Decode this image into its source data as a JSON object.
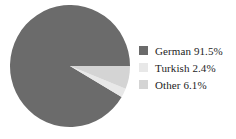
{
  "chart_data": {
    "type": "pie",
    "title": "",
    "categories": [
      "German",
      "Turkish",
      "Other"
    ],
    "values": [
      91.5,
      2.4,
      6.1
    ],
    "value_unit": "%",
    "colors": [
      "#6b6b6b",
      "#e8e8e8",
      "#d4d4d4"
    ],
    "legend_position": "right",
    "grid": false,
    "start_angle_oclock": 3,
    "direction": "counterclockwise",
    "background": "#ffffff",
    "slices": [
      {
        "label": "German",
        "value": 91.5,
        "display": "German 91.5%",
        "color": "#6b6b6b"
      },
      {
        "label": "Turkish",
        "value": 2.4,
        "display": "Turkish 2.4%",
        "color": "#e8e8e8"
      },
      {
        "label": "Other",
        "value": 6.1,
        "display": "Other 6.1%",
        "color": "#d4d4d4"
      }
    ]
  },
  "legend": {
    "entries": [
      {
        "text": "German 91.5%",
        "color": "#6b6b6b"
      },
      {
        "text": "Turkish 2.4%",
        "color": "#e8e8e8"
      },
      {
        "text": "Other 6.1%",
        "color": "#d4d4d4"
      }
    ]
  }
}
